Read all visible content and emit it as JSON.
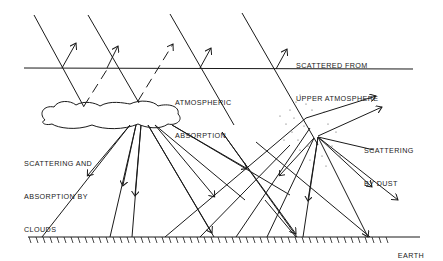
{
  "diagram": {
    "labels": {
      "upper_scatter_line1": "SCATTERED FROM",
      "upper_scatter_line2": "UPPER ATMOSPHERE",
      "atm_abs_line1": "ATMOSPHERIC",
      "atm_abs_line2": "ABSORPTION",
      "clouds_line1": "SCATTERING AND",
      "clouds_line2": "ABSORPTION BY",
      "clouds_line3": "CLOUDS",
      "dust_line1": "SCATTERING",
      "dust_line2": "BY DUST",
      "earth": "EARTH"
    },
    "colors": {
      "ink": "#1a1a1a",
      "background": "#ffffff"
    }
  }
}
